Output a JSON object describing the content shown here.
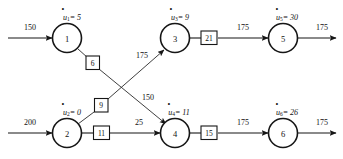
{
  "diagram": {
    "type": "directed-network",
    "stroke_color": "#161616",
    "background": "#ffffff",
    "nodes": [
      {
        "id": "1",
        "label": "1",
        "potential_var": "u",
        "potential_sub": "1",
        "potential_text": "= 5",
        "potential_value": "5",
        "cx": 67,
        "cy": 38
      },
      {
        "id": "2",
        "label": "2",
        "potential_var": "u",
        "potential_sub": "2",
        "potential_text": "= 0",
        "potential_value": "0",
        "cx": 67,
        "cy": 133
      },
      {
        "id": "3",
        "label": "3",
        "potential_var": "u",
        "potential_sub": "3",
        "potential_text": "= 9",
        "potential_value": "9",
        "cx": 175,
        "cy": 38
      },
      {
        "id": "4",
        "label": "4",
        "potential_var": "u",
        "potential_sub": "4",
        "potential_text": "= 11",
        "potential_value": "11",
        "cx": 175,
        "cy": 133
      },
      {
        "id": "5",
        "label": "5",
        "potential_var": "u",
        "potential_sub": "5",
        "potential_text": "= 30",
        "potential_value": "30",
        "cx": 283,
        "cy": 38
      },
      {
        "id": "6",
        "label": "6",
        "potential_var": "u",
        "potential_sub": "6",
        "potential_text": "= 26",
        "potential_value": "26",
        "cx": 283,
        "cy": 133
      }
    ],
    "arc_labels": [
      {
        "id": "arc-1-4",
        "value": "6",
        "x": 93,
        "y": 63
      },
      {
        "id": "arc-2-3",
        "value": "9",
        "x": 101,
        "y": 105
      },
      {
        "id": "arc-2-4",
        "value": "11",
        "x": 101,
        "y": 133
      },
      {
        "id": "arc-3-5",
        "value": "21",
        "x": 209,
        "y": 38
      },
      {
        "id": "arc-4-6",
        "value": "15",
        "x": 209,
        "y": 133
      }
    ],
    "flows": [
      {
        "id": "flow-in-1",
        "value": "150",
        "x": 30,
        "y": 27
      },
      {
        "id": "flow-in-2",
        "value": "200",
        "x": 30,
        "y": 122
      },
      {
        "id": "flow-2-3",
        "value": "175",
        "x": 142,
        "y": 55
      },
      {
        "id": "flow-1-4",
        "value": "150",
        "x": 148,
        "y": 97
      },
      {
        "id": "flow-2-4",
        "value": "25",
        "x": 139,
        "y": 122
      },
      {
        "id": "flow-3-5",
        "value": "175",
        "x": 243,
        "y": 27
      },
      {
        "id": "flow-out-5",
        "value": "175",
        "x": 322,
        "y": 27
      },
      {
        "id": "flow-4-6",
        "value": "175",
        "x": 243,
        "y": 122
      },
      {
        "id": "flow-out-6",
        "value": "175",
        "x": 322,
        "y": 122
      }
    ]
  }
}
